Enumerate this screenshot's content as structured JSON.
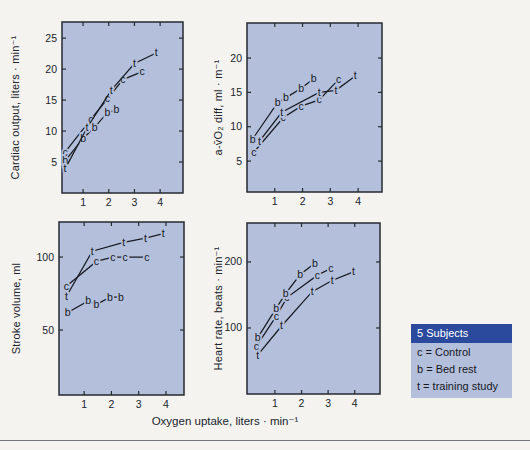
{
  "page": {
    "background": "#f4f3f0",
    "xaxis_label": "Oxygen uptake, liters · min⁻¹",
    "text_color": "#20242c",
    "rule_color": "#73767a"
  },
  "legend": {
    "header": "5 Subjects",
    "header_bg": "#2c4a9d",
    "header_color": "#ffffff",
    "body_bg": "#b4bfdb",
    "position": "bottom-right",
    "items": [
      "c = Control",
      "b = Bed rest",
      "t = training study"
    ]
  },
  "chart_data": [
    {
      "id": "cardiac-output",
      "type": "line",
      "ylabel": "Cardiac output, liters · min⁻¹",
      "xticks": [
        1,
        2,
        3,
        4
      ],
      "yticks": [
        5,
        10,
        15,
        20,
        25
      ],
      "xlim": [
        0.18,
        4.89
      ],
      "ylim": [
        0,
        27.6
      ],
      "grid": false,
      "plot_bg": "#b4bfdb",
      "frame_px": {
        "left": 62,
        "top": 22,
        "right": 183,
        "bottom": 193
      },
      "ylabel_x": 19,
      "series": [
        {
          "name": "control",
          "marker": "c",
          "points": [
            [
              0.3,
              6.6
            ],
            [
              1.3,
              11.9
            ],
            [
              1.95,
              15.2
            ],
            [
              2.55,
              18.3
            ],
            [
              3.3,
              19.6
            ]
          ]
        },
        {
          "name": "bed-rest",
          "marker": "b",
          "points": [
            [
              0.3,
              5.2
            ],
            [
              1.0,
              8.8
            ],
            [
              1.45,
              10.6
            ],
            [
              1.95,
              13.0
            ],
            [
              2.3,
              13.4
            ]
          ]
        },
        {
          "name": "training",
          "marker": "t",
          "points": [
            [
              0.3,
              3.9
            ],
            [
              1.15,
              10.5
            ],
            [
              2.1,
              16.6
            ],
            [
              3.0,
              20.9
            ],
            [
              3.85,
              22.6
            ]
          ]
        }
      ]
    },
    {
      "id": "avo2-diff",
      "type": "line",
      "ylabel": "a-v̄O₂ diff, ml · m⁻¹",
      "xticks": [
        1,
        2,
        3,
        4
      ],
      "yticks": [
        5,
        10,
        15,
        20
      ],
      "xlim": [
        0,
        4.86
      ],
      "ylim": [
        0.5,
        25.1
      ],
      "grid": false,
      "plot_bg": "#b4bfdb",
      "frame_px": {
        "left": 247,
        "top": 23,
        "right": 382,
        "bottom": 192
      },
      "ylabel_x": 222,
      "series": [
        {
          "name": "control",
          "marker": "c",
          "points": [
            [
              0.25,
              6.3
            ],
            [
              1.3,
              11.3
            ],
            [
              1.95,
              13.0
            ],
            [
              2.6,
              13.9
            ],
            [
              3.3,
              16.9
            ]
          ]
        },
        {
          "name": "bed-rest",
          "marker": "b",
          "points": [
            [
              0.2,
              8.2
            ],
            [
              1.1,
              13.5
            ],
            [
              1.4,
              14.2
            ],
            [
              1.95,
              15.6
            ],
            [
              2.4,
              17.0
            ]
          ]
        },
        {
          "name": "training",
          "marker": "t",
          "points": [
            [
              0.45,
              7.9
            ],
            [
              1.25,
              12.1
            ],
            [
              2.6,
              15.0
            ],
            [
              3.2,
              15.3
            ],
            [
              3.9,
              17.4
            ]
          ]
        }
      ]
    },
    {
      "id": "stroke-volume",
      "type": "line",
      "ylabel": "Stroke volume, ml",
      "xticks": [
        1,
        2,
        3,
        4
      ],
      "yticks": [
        50,
        100
      ],
      "xlim": [
        0.08,
        4.66
      ],
      "ylim": [
        5.5,
        124
      ],
      "grid": false,
      "plot_bg": "#b4bfdb",
      "frame_px": {
        "left": 59,
        "top": 222,
        "right": 184,
        "bottom": 395
      },
      "ylabel_x": 20,
      "series": [
        {
          "name": "control",
          "marker": "c",
          "points": [
            [
              0.35,
              80
            ],
            [
              1.45,
              97
            ],
            [
              2.05,
              100
            ],
            [
              2.5,
              100
            ],
            [
              3.3,
              100
            ]
          ]
        },
        {
          "name": "bed-rest",
          "marker": "b",
          "points": [
            [
              0.4,
              62
            ],
            [
              1.15,
              70
            ],
            [
              1.45,
              67.5
            ],
            [
              1.95,
              72.5
            ],
            [
              2.35,
              72.5
            ]
          ]
        },
        {
          "name": "training",
          "marker": "t",
          "points": [
            [
              0.35,
              73
            ],
            [
              1.3,
              104
            ],
            [
              2.45,
              110
            ],
            [
              3.25,
              113
            ],
            [
              3.9,
              116
            ]
          ]
        }
      ]
    },
    {
      "id": "heart-rate",
      "type": "line",
      "ylabel": "Heart rate, beats · min⁻¹",
      "xticks": [
        1,
        2,
        3,
        4
      ],
      "yticks": [
        100,
        200
      ],
      "xlim": [
        -0.05,
        4.95
      ],
      "ylim": [
        0,
        259
      ],
      "grid": false,
      "plot_bg": "#b4bfdb",
      "frame_px": {
        "left": 247,
        "top": 223,
        "right": 380,
        "bottom": 394
      },
      "ylabel_x": 222,
      "series": [
        {
          "name": "control",
          "marker": "c",
          "points": [
            [
              0.3,
              72
            ],
            [
              1.05,
              118
            ],
            [
              1.45,
              146
            ],
            [
              2.6,
              180
            ],
            [
              3.1,
              190
            ]
          ]
        },
        {
          "name": "bed-rest",
          "marker": "b",
          "points": [
            [
              0.35,
              85
            ],
            [
              1.05,
              130
            ],
            [
              1.4,
              152
            ],
            [
              1.95,
              181
            ],
            [
              2.5,
              198
            ]
          ]
        },
        {
          "name": "training",
          "marker": "t",
          "points": [
            [
              0.35,
              59
            ],
            [
              1.25,
              103
            ],
            [
              2.4,
              155
            ],
            [
              3.15,
              172
            ],
            [
              3.95,
              185
            ]
          ]
        }
      ]
    }
  ]
}
